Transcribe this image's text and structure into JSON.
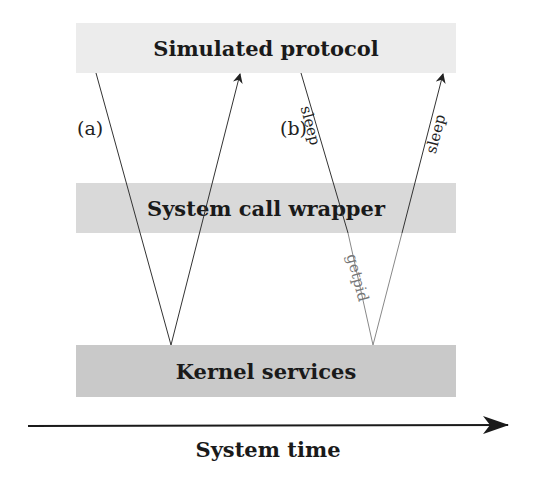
{
  "layers": {
    "top": "Simulated protocol",
    "middle": "System call wrapper",
    "bottom": "Kernel services"
  },
  "paths": {
    "a": {
      "tag": "(a)"
    },
    "b": {
      "tag": "(b)",
      "down_label": "sleep",
      "inner_label": "getpid",
      "up_label": "sleep"
    }
  },
  "axis": {
    "label": "System time"
  },
  "colors": {
    "top_layer": "#ececec",
    "middle_layer": "#d9d9d9",
    "bottom_layer": "#c9c9c9",
    "line": "#333333",
    "getpid_line": "#888888"
  }
}
